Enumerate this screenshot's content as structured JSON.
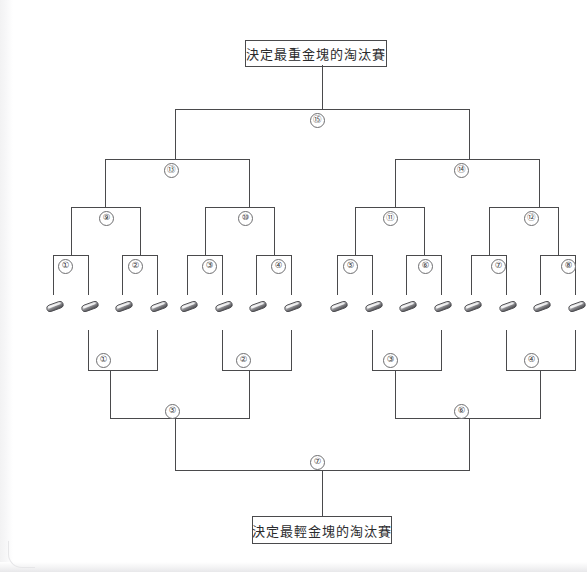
{
  "diagram": {
    "type": "tournament-bracket",
    "orientation": "double-vertical",
    "top_title": "決定最重金塊的淘汰賽",
    "bottom_title": "決定最輕金塊的淘汰賽",
    "nugget_count": 16,
    "nugget_label": "gold-nugget",
    "colors": {
      "line": "#4a4a4c",
      "badge_border": "#6e6e70",
      "page": "#ffffff",
      "background": "#ececed",
      "text": "#2b2b2d"
    },
    "upper_bracket": {
      "name": "heaviest-nugget-elimination",
      "rounds": [
        {
          "level": 1,
          "matches": [
            "①",
            "②",
            "③",
            "④",
            "⑤",
            "⑥",
            "⑦",
            "⑧"
          ]
        },
        {
          "level": 2,
          "matches": [
            "⑨",
            "⑩",
            "⑪",
            "⑫"
          ]
        },
        {
          "level": 3,
          "matches": [
            "⑬",
            "⑭"
          ]
        },
        {
          "level": 4,
          "matches": [
            "⑮"
          ]
        }
      ]
    },
    "lower_bracket": {
      "name": "lightest-nugget-elimination",
      "rounds": [
        {
          "level": 1,
          "matches": [
            "①",
            "②",
            "③",
            "④"
          ]
        },
        {
          "level": 2,
          "matches": [
            "⑤",
            "⑥"
          ]
        },
        {
          "level": 3,
          "matches": [
            "⑦"
          ]
        }
      ]
    }
  }
}
